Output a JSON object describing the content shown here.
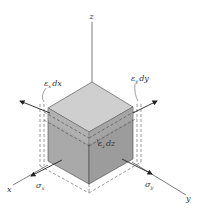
{
  "figure": {
    "axes": {
      "x": "x",
      "y": "y",
      "z": "z"
    },
    "labels": {
      "strain_x": {
        "eps": "ε",
        "sub": "x",
        "rest": "dx"
      },
      "strain_y": {
        "eps": "ε",
        "sub": "y",
        "rest": "dy"
      },
      "strain_z": {
        "eps": "ε",
        "sub": "z",
        "rest": "dz"
      },
      "stress_x": {
        "sym": "σ",
        "sub": "x"
      },
      "stress_y": {
        "sym": "σ",
        "sub": "y"
      }
    },
    "colors": {
      "top_face": "#c8c8c8",
      "left_face": "#a6a6a6",
      "right_face": "#9a9a9a",
      "band": "#b3b3b3",
      "line": "#333333",
      "dashed": "#555555"
    }
  }
}
